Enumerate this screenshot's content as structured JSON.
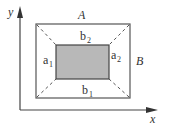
{
  "diagram": {
    "axes": {
      "x_label": "x",
      "y_label": "y"
    },
    "outer_rect": {
      "label_top": "A",
      "label_right": "B"
    },
    "inner_rect": {
      "fill": "#b8b8b8"
    },
    "labels": {
      "a1_main": "a",
      "a1_sub": "1",
      "a2_main": "a",
      "a2_sub": "2",
      "b1_main": "b",
      "b1_sub": "1",
      "b2_main": "b",
      "b2_sub": "2"
    },
    "colors": {
      "stroke": "#444444",
      "inner_fill": "#b8b8b8"
    }
  }
}
